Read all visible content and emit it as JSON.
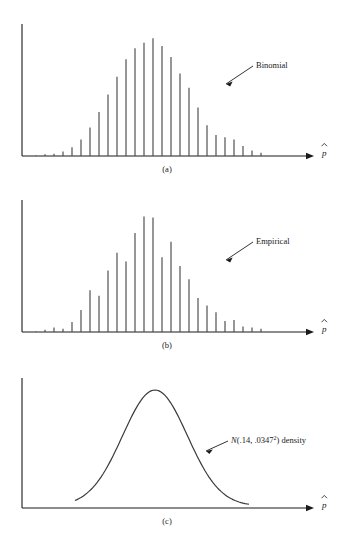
{
  "figure": {
    "axis_label": "p̂",
    "axis_label_base": "p",
    "panels": [
      {
        "id": "a",
        "caption": "(a)",
        "annotation": "Binomial",
        "type": "spike"
      },
      {
        "id": "b",
        "caption": "(b)",
        "annotation": "Empirical",
        "type": "spike"
      },
      {
        "id": "c",
        "caption": "(c)",
        "annotation_prefix": "N(.14, .0347",
        "annotation_exponent": "2",
        "annotation_suffix": ") density",
        "annotation_full": "N(.14, .0347²) density",
        "type": "curve"
      }
    ],
    "colors": {
      "ink": "#1a1a1a",
      "spike": "#4a4a4a",
      "curve": "#3a3a3a",
      "background": "#ffffff"
    }
  },
  "chart_data": [
    {
      "type": "bar",
      "panel": "a",
      "title": "Binomial",
      "xlabel": "p̂",
      "ylabel": "",
      "grid": false,
      "legend": "annotation-arrow",
      "axis_origin_px": [
        22,
        156
      ],
      "axis_end_px": [
        312,
        156
      ],
      "x_px": [
        36,
        45,
        54,
        63,
        72,
        81,
        90,
        99,
        108,
        117,
        126,
        135,
        144,
        153,
        162,
        171,
        180,
        189,
        198,
        207,
        216,
        225,
        234
      ],
      "values": [
        0.5,
        1.5,
        2,
        4,
        8,
        15,
        26,
        40,
        56,
        72,
        88,
        98,
        103,
        107,
        100,
        90,
        75,
        62,
        44,
        28,
        19,
        17,
        15
      ],
      "tail_x_px": [
        243,
        252,
        261
      ],
      "tail_values": [
        9,
        5,
        3
      ],
      "ylim": [
        0,
        120
      ],
      "note": "Binomial pmf spikes, smooth unimodal envelope peaking just right of center"
    },
    {
      "type": "bar",
      "panel": "b",
      "title": "Empirical",
      "xlabel": "p̂",
      "ylabel": "",
      "grid": false,
      "legend": "annotation-arrow",
      "axis_origin_px": [
        22,
        332
      ],
      "axis_end_px": [
        312,
        332
      ],
      "x_px": [
        36,
        45,
        54,
        63,
        72,
        81,
        90,
        99,
        108,
        117,
        126,
        135,
        144,
        153,
        162,
        171,
        180,
        189,
        198,
        207,
        216,
        225,
        234
      ],
      "values": [
        0.5,
        2,
        4,
        3,
        9,
        20,
        38,
        33,
        56,
        72,
        64,
        90,
        105,
        104,
        68,
        82,
        60,
        48,
        31,
        24,
        18,
        10,
        11
      ],
      "tail_x_px": [
        243,
        252,
        261
      ],
      "tail_values": [
        5,
        4,
        3
      ],
      "ylim": [
        0,
        120
      ],
      "note": "Empirical (simulated) relative frequencies, irregular jagged envelope"
    },
    {
      "type": "line",
      "panel": "c",
      "title": "N(.14, .0347²) density",
      "xlabel": "p̂",
      "ylabel": "",
      "grid": false,
      "mean": 0.14,
      "sd": 0.0347,
      "axis_origin_px": [
        22,
        508
      ],
      "axis_end_px": [
        312,
        508
      ],
      "peak_px": [
        155,
        390
      ],
      "x_start_px": 75,
      "x_end_px": 250,
      "ylim": [
        0,
        1
      ],
      "note": "Normal density bell curve, peak near x=155px, tails flatten around x=75 and x=250"
    }
  ]
}
